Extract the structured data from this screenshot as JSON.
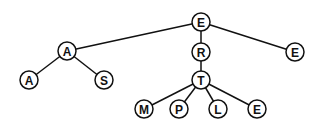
{
  "diagram": {
    "type": "tree",
    "node_radius": 9,
    "nodes": [
      {
        "id": "n0",
        "label": "E",
        "x": 201,
        "y": 22
      },
      {
        "id": "n1",
        "label": "A",
        "x": 67,
        "y": 51
      },
      {
        "id": "n2",
        "label": "R",
        "x": 201,
        "y": 52
      },
      {
        "id": "n3",
        "label": "E",
        "x": 295,
        "y": 52
      },
      {
        "id": "n4",
        "label": "A",
        "x": 29,
        "y": 80
      },
      {
        "id": "n5",
        "label": "S",
        "x": 104,
        "y": 80
      },
      {
        "id": "n6",
        "label": "T",
        "x": 201,
        "y": 80
      },
      {
        "id": "n7",
        "label": "M",
        "x": 144,
        "y": 109
      },
      {
        "id": "n8",
        "label": "P",
        "x": 179,
        "y": 109
      },
      {
        "id": "n9",
        "label": "L",
        "x": 218,
        "y": 109
      },
      {
        "id": "n10",
        "label": "E",
        "x": 257,
        "y": 109
      }
    ],
    "edges": [
      [
        "n0",
        "n1"
      ],
      [
        "n0",
        "n2"
      ],
      [
        "n0",
        "n3"
      ],
      [
        "n1",
        "n4"
      ],
      [
        "n1",
        "n5"
      ],
      [
        "n2",
        "n6"
      ],
      [
        "n6",
        "n7"
      ],
      [
        "n6",
        "n8"
      ],
      [
        "n6",
        "n9"
      ],
      [
        "n6",
        "n10"
      ]
    ]
  }
}
